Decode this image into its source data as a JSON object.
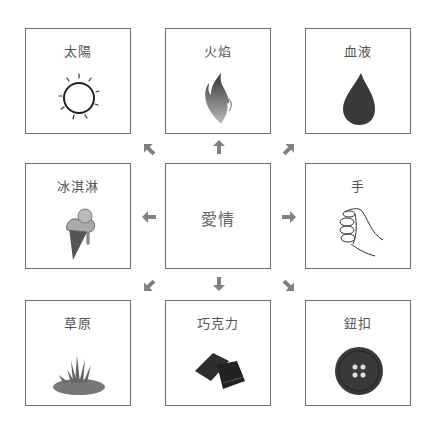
{
  "center": {
    "label": "愛情"
  },
  "nodes": [
    {
      "id": "sun",
      "label": "太陽",
      "icon": "sun-icon"
    },
    {
      "id": "fire",
      "label": "火焰",
      "icon": "flame-icon"
    },
    {
      "id": "blood",
      "label": "血液",
      "icon": "blood-drop-icon"
    },
    {
      "id": "icecream",
      "label": "冰淇淋",
      "icon": "ice-cream-icon"
    },
    {
      "id": "hand",
      "label": "手",
      "icon": "fist-icon"
    },
    {
      "id": "grass",
      "label": "草原",
      "icon": "grass-icon"
    },
    {
      "id": "chocolate",
      "label": "巧克力",
      "icon": "chocolate-icon"
    },
    {
      "id": "button",
      "label": "鈕扣",
      "icon": "button-icon"
    }
  ],
  "colors": {
    "border": "#6e6e6e",
    "arrow": "#808080",
    "text": "#555555"
  }
}
